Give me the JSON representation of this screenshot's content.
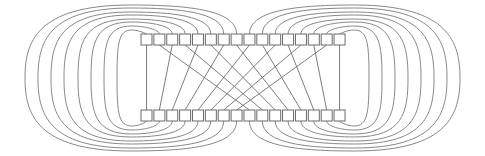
{
  "diagram": {
    "type": "perfect-shuffle-network",
    "node_count_per_row": 16,
    "rows": [
      "top",
      "bottom"
    ],
    "colors": {
      "line": "#7a7a7a",
      "node_stroke": "#6a6a6a",
      "node_fill": "#ffffff",
      "background": "#ffffff"
    },
    "layout": {
      "first_node_x": 141,
      "node_pitch": 12.87,
      "node_width": 11,
      "node_height": 11,
      "top_row_y": 34,
      "bottom_row_y": 110,
      "mid_y": 78
    },
    "crossing_edges": [
      {
        "from_top": 0,
        "to_bottom": 0
      },
      {
        "from_top": 1,
        "to_bottom": 8
      },
      {
        "from_top": 2,
        "to_bottom": 1
      },
      {
        "from_top": 3,
        "to_bottom": 9
      },
      {
        "from_top": 4,
        "to_bottom": 2
      },
      {
        "from_top": 5,
        "to_bottom": 10
      },
      {
        "from_top": 6,
        "to_bottom": 3
      },
      {
        "from_top": 7,
        "to_bottom": 11
      },
      {
        "from_top": 8,
        "to_bottom": 4
      },
      {
        "from_top": 9,
        "to_bottom": 12
      },
      {
        "from_top": 10,
        "to_bottom": 5
      },
      {
        "from_top": 11,
        "to_bottom": 13
      },
      {
        "from_top": 12,
        "to_bottom": 6
      },
      {
        "from_top": 13,
        "to_bottom": 14
      },
      {
        "from_top": 14,
        "to_bottom": 7
      },
      {
        "from_top": 15,
        "to_bottom": 15
      }
    ],
    "loop_edges": [
      {
        "node": 0,
        "side": "left",
        "extreme_x": 117,
        "peak_y": 30
      },
      {
        "node": 1,
        "side": "left",
        "extreme_x": 104,
        "peak_y": 26
      },
      {
        "node": 2,
        "side": "left",
        "extreme_x": 91,
        "peak_y": 22
      },
      {
        "node": 3,
        "side": "left",
        "extreme_x": 78,
        "peak_y": 19
      },
      {
        "node": 4,
        "side": "left",
        "extreme_x": 64,
        "peak_y": 15
      },
      {
        "node": 5,
        "side": "left",
        "extreme_x": 51,
        "peak_y": 12
      },
      {
        "node": 6,
        "side": "left",
        "extreme_x": 38,
        "peak_y": 8
      },
      {
        "node": 7,
        "side": "left",
        "extreme_x": 25,
        "peak_y": 5
      },
      {
        "node": 8,
        "side": "right",
        "extreme_x": 460,
        "peak_y": 5
      },
      {
        "node": 9,
        "side": "right",
        "extreme_x": 447,
        "peak_y": 8
      },
      {
        "node": 10,
        "side": "right",
        "extreme_x": 434,
        "peak_y": 12
      },
      {
        "node": 11,
        "side": "right",
        "extreme_x": 421,
        "peak_y": 15
      },
      {
        "node": 12,
        "side": "right",
        "extreme_x": 408,
        "peak_y": 19
      },
      {
        "node": 13,
        "side": "right",
        "extreme_x": 395,
        "peak_y": 22
      },
      {
        "node": 14,
        "side": "right",
        "extreme_x": 382,
        "peak_y": 26
      },
      {
        "node": 15,
        "side": "right",
        "extreme_x": 369,
        "peak_y": 30
      }
    ]
  }
}
